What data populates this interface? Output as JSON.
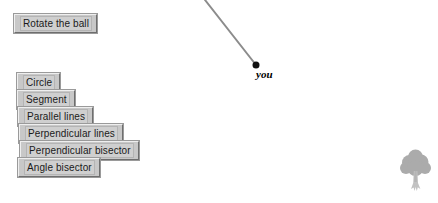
{
  "app": {
    "background_color": "#ffffff",
    "width": 438,
    "height": 203
  },
  "toolbar": {
    "action_button": {
      "label": "Rotate the ball",
      "name": "rotate-the-ball-button"
    },
    "tools": [
      {
        "label": "Circle",
        "name": "circle-tool-button"
      },
      {
        "label": "Segment",
        "name": "segment-tool-button"
      },
      {
        "label": "Parallel lines",
        "name": "parallel-lines-tool-button"
      },
      {
        "label": "Perpendicular lines",
        "name": "perpendicular-lines-tool-button"
      },
      {
        "label": "Perpendicular bisector",
        "name": "perpendicular-bisector-tool-button"
      },
      {
        "label": "Angle bisector",
        "name": "angle-bisector-tool-button"
      }
    ],
    "button_face_color": "#c8c8c8",
    "button_text_color": "#1a1a1a"
  },
  "canvas": {
    "line": {
      "color": "#8c8c8c",
      "width": 2,
      "x1": 205,
      "y1": 0,
      "x2": 256,
      "y2": 65
    },
    "point": {
      "label": "you",
      "color": "#111111",
      "radius": 3.5,
      "x": 256,
      "y": 65
    },
    "tree": {
      "name": "tree-icon",
      "canopy_color": "#a8a8a8",
      "trunk_color": "#c4c4c4"
    }
  }
}
